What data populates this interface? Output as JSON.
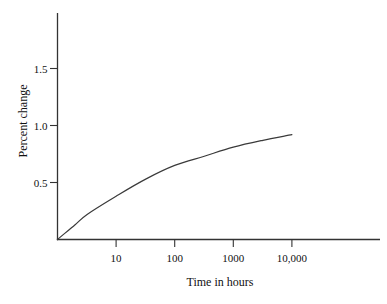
{
  "chart_data": {
    "type": "line",
    "title": "",
    "xlabel": "Time in hours",
    "ylabel": "Percent change",
    "x_scale": "log10",
    "grid": false,
    "legend": "none",
    "xlim": [
      1,
      316000
    ],
    "ylim": [
      0,
      1.99
    ],
    "x_ticks": [
      {
        "value": 10,
        "label": "10"
      },
      {
        "value": 100,
        "label": "100"
      },
      {
        "value": 1000,
        "label": "1000"
      },
      {
        "value": 10000,
        "label": "10,000"
      }
    ],
    "y_ticks": [
      {
        "value": 0.5,
        "label": "0.5"
      },
      {
        "value": 1.0,
        "label": "1.0"
      },
      {
        "value": 1.5,
        "label": "1.5"
      }
    ],
    "series": [
      {
        "name": "percent-change-vs-time",
        "points": [
          {
            "t": 1,
            "v": 0.0
          },
          {
            "t": 2,
            "v": 0.13
          },
          {
            "t": 3.2,
            "v": 0.22
          },
          {
            "t": 10,
            "v": 0.38
          },
          {
            "t": 32,
            "v": 0.53
          },
          {
            "t": 100,
            "v": 0.65
          },
          {
            "t": 320,
            "v": 0.73
          },
          {
            "t": 1000,
            "v": 0.81
          },
          {
            "t": 3200,
            "v": 0.87
          },
          {
            "t": 10000,
            "v": 0.92
          }
        ]
      }
    ],
    "colors": {
      "axis": "#333333",
      "curve": "#3a3a3a",
      "text": "#111111",
      "background": "#ffffff"
    }
  }
}
